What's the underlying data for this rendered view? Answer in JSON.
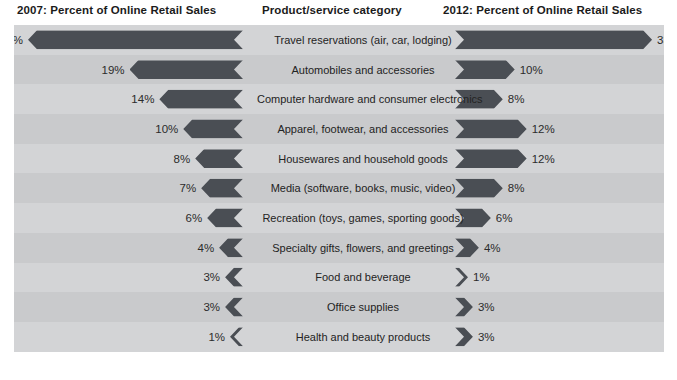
{
  "headers": {
    "left": "2007: Percent of Online Retail Sales",
    "middle": "Product/service category",
    "right": "2012: Percent of Online Retail Sales"
  },
  "colors": {
    "bar": "#4a4e54",
    "panel_background": "#d3d4d6",
    "panel_band_alt": "#c9cacc",
    "text": "#232323",
    "page_background": "#ffffff"
  },
  "chart_data": {
    "type": "bar",
    "subtype": "tornado",
    "title": "",
    "xlabel": "",
    "ylabel": "",
    "categories": [
      "Travel reservations (air, car, lodging)",
      "Automobiles and accessories",
      "Computer hardware and consumer electronics",
      "Apparel, footwear, and accessories",
      "Housewares and household goods",
      "Media (software, books, music, video)",
      "Recreation (toys, games, sporting goods)",
      "Specialty gifts, flowers, and greetings",
      "Food and beverage",
      "Office supplies",
      "Health and beauty products"
    ],
    "series": [
      {
        "name": "2007: Percent of Online Retail Sales",
        "values": [
          36,
          19,
          14,
          10,
          8,
          7,
          6,
          4,
          3,
          3,
          1
        ],
        "labels": [
          "36%",
          "19%",
          "14%",
          "10%",
          "8%",
          "7%",
          "6%",
          "4%",
          "3%",
          "3%",
          "1%"
        ],
        "side": "left"
      },
      {
        "name": "2012: Percent of Online Retail Sales",
        "values": [
          33,
          10,
          8,
          12,
          12,
          8,
          6,
          4,
          1,
          3,
          3
        ],
        "labels": [
          "33%",
          "10%",
          "8%",
          "12%",
          "12%",
          "8%",
          "6%",
          "4%",
          "1%",
          "3%",
          "3%"
        ],
        "side": "right"
      }
    ],
    "xlim": [
      0,
      36
    ],
    "grid": false,
    "legend": "none",
    "units": "percent"
  },
  "rows": [
    {
      "category": "Travel reservations (air, car, lodging)",
      "left_label": "36%",
      "left_value": 36,
      "right_label": "33%",
      "right_value": 33
    },
    {
      "category": "Automobiles and accessories",
      "left_label": "19%",
      "left_value": 19,
      "right_label": "10%",
      "right_value": 10
    },
    {
      "category": "Computer hardware and consumer electronics",
      "left_label": "14%",
      "left_value": 14,
      "right_label": "8%",
      "right_value": 8
    },
    {
      "category": "Apparel, footwear, and accessories",
      "left_label": "10%",
      "left_value": 10,
      "right_label": "12%",
      "right_value": 12
    },
    {
      "category": "Housewares and household goods",
      "left_label": "8%",
      "left_value": 8,
      "right_label": "12%",
      "right_value": 12
    },
    {
      "category": "Media (software, books, music, video)",
      "left_label": "7%",
      "left_value": 7,
      "right_label": "8%",
      "right_value": 8
    },
    {
      "category": "Recreation (toys, games, sporting goods)",
      "left_label": "6%",
      "left_value": 6,
      "right_label": "6%",
      "right_value": 6
    },
    {
      "category": "Specialty gifts, flowers, and greetings",
      "left_label": "4%",
      "left_value": 4,
      "right_label": "4%",
      "right_value": 4
    },
    {
      "category": "Food and beverage",
      "left_label": "3%",
      "left_value": 3,
      "right_label": "1%",
      "right_value": 1
    },
    {
      "category": "Office supplies",
      "left_label": "3%",
      "left_value": 3,
      "right_label": "3%",
      "right_value": 3
    },
    {
      "category": "Health and beauty products",
      "left_label": "1%",
      "left_value": 1,
      "right_label": "3%",
      "right_value": 3
    }
  ]
}
